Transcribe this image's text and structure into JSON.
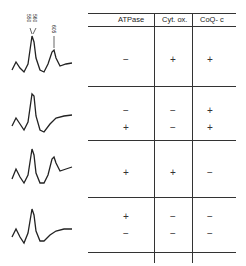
{
  "spectra": [
    {
      "peak_labels": [
        "550",
        "560",
        "605"
      ]
    },
    {},
    {},
    {}
  ],
  "table": {
    "headers": [
      "ATPase",
      "Cyt. ox.",
      "CoQ- c"
    ],
    "rows": [
      {
        "atpase": [
          "−"
        ],
        "cytox": [
          "+"
        ],
        "coqc": [
          "+"
        ]
      },
      {
        "atpase": [
          "−",
          "+"
        ],
        "cytox": [
          "−",
          "−"
        ],
        "coqc": [
          "+",
          "+"
        ]
      },
      {
        "atpase": [
          "+"
        ],
        "cytox": [
          "+"
        ],
        "coqc": [
          "−"
        ]
      },
      {
        "atpase": [
          "+",
          "−"
        ],
        "cytox": [
          "−",
          "−"
        ],
        "coqc": [
          "−",
          "−"
        ]
      }
    ]
  }
}
